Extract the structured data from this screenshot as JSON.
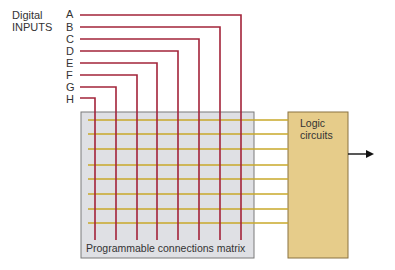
{
  "diagram": {
    "title_line1": "Digital",
    "title_line2": "INPUTS",
    "inputs": [
      "A",
      "B",
      "C",
      "D",
      "E",
      "F",
      "G",
      "H"
    ],
    "matrix_label": "Programmable connections matrix",
    "logic_label_line1": "Logic",
    "logic_label_line2": "circuits",
    "colors": {
      "input_wire": "#a3243a",
      "matrix_wire": "#c9a82a",
      "matrix_fill": "#dfe0e4",
      "matrix_border": "#7a7a7a",
      "logic_fill": "#e6cc8a",
      "logic_border": "#8a7340",
      "arrow": "#111111"
    }
  }
}
